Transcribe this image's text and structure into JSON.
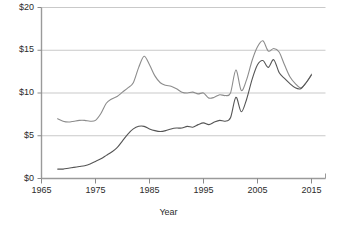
{
  "chart_data": {
    "type": "line",
    "title": "",
    "subtitle": "",
    "xlabel": "Year",
    "ylabel": "",
    "xlim": [
      1965,
      2015
    ],
    "ylim": [
      0,
      20
    ],
    "grid": true,
    "grid_axis": "y",
    "legend": "none",
    "x_tick_labels": [
      "1965",
      "1975",
      "1985",
      "1995",
      "2005",
      "2015"
    ],
    "x_ticks": [
      1965,
      1975,
      1985,
      1995,
      2005,
      2015
    ],
    "y_tick_labels": [
      "$0",
      "$5",
      "$10",
      "$15",
      "$20"
    ],
    "y_ticks": [
      0,
      5,
      10,
      15,
      20
    ],
    "value_prefix": "$",
    "series": [
      {
        "name": "upper-line",
        "color": "#8c8c8c",
        "x": [
          1968,
          1969,
          1970,
          1971,
          1972,
          1973,
          1974,
          1975,
          1976,
          1977,
          1978,
          1979,
          1980,
          1981,
          1982,
          1983,
          1984,
          1985,
          1986,
          1987,
          1988,
          1989,
          1990,
          1991,
          1992,
          1993,
          1994,
          1995,
          1996,
          1997,
          1998,
          1999,
          2000,
          2001,
          2002,
          2003,
          2004,
          2005,
          2006,
          2007,
          2008,
          2009,
          2010,
          2011,
          2012,
          2013,
          2014,
          2015
        ],
        "values": [
          7.0,
          6.7,
          6.6,
          6.7,
          6.8,
          6.8,
          6.7,
          6.8,
          7.6,
          8.8,
          9.3,
          9.6,
          10.1,
          10.6,
          11.2,
          13.0,
          14.3,
          13.3,
          12.0,
          11.2,
          10.9,
          10.8,
          10.5,
          10.1,
          10.0,
          10.1,
          9.9,
          10.0,
          9.4,
          9.5,
          9.8,
          9.7,
          10.0,
          12.7,
          10.3,
          11.6,
          13.8,
          15.4,
          16.1,
          14.9,
          15.2,
          14.8,
          13.3,
          11.9,
          11.1,
          10.6,
          11.2,
          12.2
        ]
      },
      {
        "name": "lower-line",
        "color": "#555555",
        "x": [
          1968,
          1969,
          1970,
          1971,
          1972,
          1973,
          1974,
          1975,
          1976,
          1977,
          1978,
          1979,
          1980,
          1981,
          1982,
          1983,
          1984,
          1985,
          1986,
          1987,
          1988,
          1989,
          1990,
          1991,
          1992,
          1993,
          1994,
          1995,
          1996,
          1997,
          1998,
          1999,
          2000,
          2001,
          2002,
          2003,
          2004,
          2005,
          2006,
          2007,
          2008,
          2009,
          2010,
          2011,
          2012,
          2013,
          2014,
          2015
        ],
        "values": [
          1.1,
          1.1,
          1.2,
          1.3,
          1.4,
          1.5,
          1.7,
          2.0,
          2.3,
          2.7,
          3.1,
          3.6,
          4.4,
          5.2,
          5.8,
          6.1,
          6.1,
          5.8,
          5.6,
          5.5,
          5.6,
          5.8,
          5.9,
          5.9,
          6.1,
          6.0,
          6.3,
          6.5,
          6.3,
          6.6,
          6.8,
          6.7,
          7.1,
          9.5,
          7.8,
          9.3,
          11.6,
          13.3,
          13.8,
          13.0,
          13.9,
          12.4,
          11.7,
          11.1,
          10.6,
          10.5,
          11.2,
          12.1
        ]
      }
    ]
  },
  "axis": {
    "x_title": "Year"
  }
}
